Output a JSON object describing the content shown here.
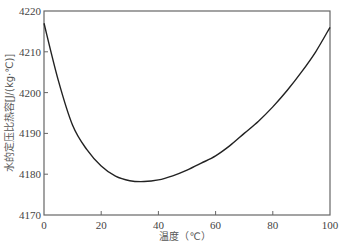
{
  "chart_data": {
    "type": "line",
    "title": "",
    "xlabel": "温度（℃）",
    "ylabel": "水的定压比热容[J/(kg·℃)]",
    "xlim": [
      0,
      100
    ],
    "ylim": [
      4170,
      4220
    ],
    "xticks": [
      0,
      20,
      40,
      60,
      80,
      100
    ],
    "yticks": [
      4170,
      4180,
      4190,
      4200,
      4210,
      4220
    ],
    "grid": false,
    "legend": null,
    "series": [
      {
        "name": "specific heat of water",
        "x": [
          0,
          5,
          10,
          15,
          20,
          25,
          30,
          35,
          40,
          45,
          50,
          55,
          60,
          65,
          70,
          75,
          80,
          85,
          90,
          95,
          100
        ],
        "values": [
          4217,
          4203,
          4192,
          4186,
          4182,
          4179.5,
          4178.4,
          4178.2,
          4178.6,
          4179.6,
          4181,
          4182.7,
          4184.5,
          4187,
          4190,
          4193,
          4196.5,
          4200.5,
          4205,
          4210,
          4216
        ]
      }
    ]
  },
  "colors": {
    "line": "#222222",
    "axis": "#666666"
  }
}
